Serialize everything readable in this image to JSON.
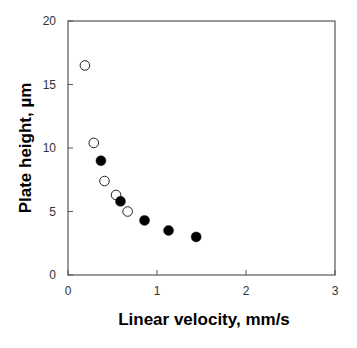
{
  "chart_data": {
    "type": "scatter",
    "title": "",
    "xlabel": "Linear velocity, mm/s",
    "ylabel": "Plate height, µm",
    "xlim": [
      0,
      3
    ],
    "ylim": [
      0,
      20
    ],
    "x_ticks": [
      0,
      1,
      2,
      3
    ],
    "y_ticks": [
      0,
      5,
      10,
      15,
      20
    ],
    "grid": false,
    "legend": null,
    "series": [
      {
        "name": "open circles",
        "marker": "open-circle",
        "x": [
          0.19,
          0.29,
          0.41,
          0.54,
          0.67
        ],
        "y": [
          16.5,
          10.4,
          7.4,
          6.3,
          5.0
        ]
      },
      {
        "name": "filled circles",
        "marker": "filled-circle",
        "x": [
          0.37,
          0.59,
          0.86,
          1.13,
          1.44
        ],
        "y": [
          9.0,
          5.8,
          4.3,
          3.5,
          3.0
        ]
      }
    ]
  },
  "colors": {
    "axis": "#555555",
    "marker_fill": "#000000",
    "marker_stroke": "#222222",
    "background": "#ffffff"
  }
}
